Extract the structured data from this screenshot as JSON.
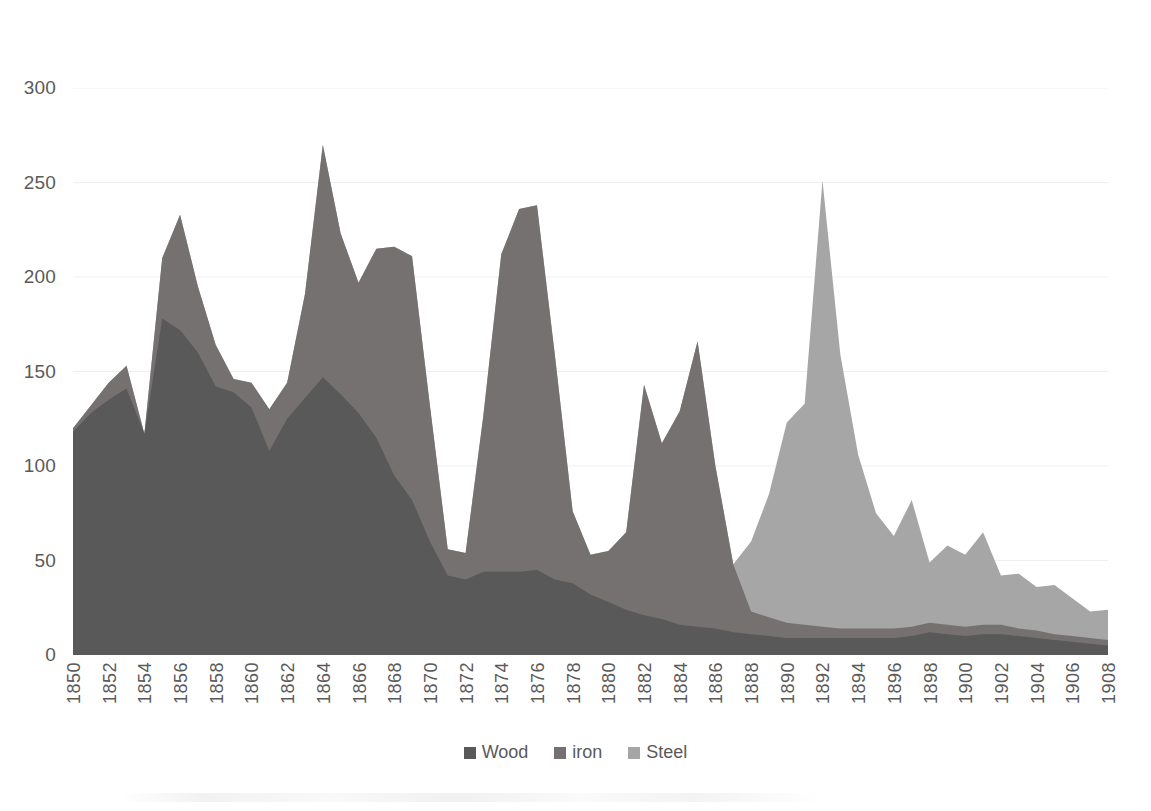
{
  "chart_data": {
    "type": "area",
    "stacked": true,
    "title": "",
    "subtitle": "",
    "xlabel": "",
    "ylabel": "",
    "xlim": [
      1850,
      1908
    ],
    "ylim": [
      0,
      300
    ],
    "grid": true,
    "grid_axis": "y",
    "legend_position": "bottom",
    "y_ticks": [
      0,
      50,
      100,
      150,
      200,
      250,
      300
    ],
    "x_tick_labels": [
      "1850",
      "1852",
      "1854",
      "1856",
      "1858",
      "1860",
      "1862",
      "1864",
      "1866",
      "1868",
      "1870",
      "1872",
      "1874",
      "1876",
      "1878",
      "1880",
      "1882",
      "1884",
      "1886",
      "1888",
      "1890",
      "1892",
      "1894",
      "1896",
      "1898",
      "1900",
      "1902",
      "1904",
      "1906",
      "1908"
    ],
    "x": [
      1850,
      1851,
      1852,
      1853,
      1854,
      1855,
      1856,
      1857,
      1858,
      1859,
      1860,
      1861,
      1862,
      1863,
      1864,
      1865,
      1866,
      1867,
      1868,
      1869,
      1870,
      1871,
      1872,
      1873,
      1874,
      1875,
      1876,
      1877,
      1878,
      1879,
      1880,
      1881,
      1882,
      1883,
      1884,
      1885,
      1886,
      1887,
      1888,
      1889,
      1890,
      1891,
      1892,
      1893,
      1894,
      1895,
      1896,
      1897,
      1898,
      1899,
      1900,
      1901,
      1902,
      1903,
      1904,
      1905,
      1906,
      1907,
      1908
    ],
    "series": [
      {
        "name": "Wood",
        "color": "#595959",
        "values": [
          118,
          128,
          135,
          141,
          117,
          178,
          172,
          160,
          142,
          139,
          131,
          108,
          125,
          136,
          147,
          138,
          128,
          115,
          95,
          82,
          60,
          42,
          40,
          44,
          44,
          44,
          45,
          40,
          38,
          32,
          28,
          24,
          21,
          19,
          16,
          15,
          14,
          12,
          11,
          10,
          9,
          9,
          9,
          9,
          9,
          9,
          9,
          10,
          12,
          11,
          10,
          11,
          11,
          10,
          9,
          8,
          7,
          6,
          5
        ]
      },
      {
        "name": "iron",
        "color": "#767171",
        "values": [
          2,
          4,
          9,
          12,
          0,
          32,
          61,
          35,
          22,
          7,
          13,
          22,
          19,
          55,
          123,
          85,
          69,
          100,
          121,
          129,
          72,
          14,
          14,
          83,
          168,
          192,
          193,
          119,
          38,
          21,
          27,
          41,
          122,
          93,
          113,
          151,
          86,
          36,
          12,
          10,
          8,
          7,
          6,
          5,
          5,
          5,
          5,
          5,
          5,
          5,
          5,
          5,
          5,
          4,
          4,
          3,
          3,
          3,
          3
        ]
      },
      {
        "name": "Steel",
        "color": "#a6a6a6",
        "values": [
          0,
          0,
          0,
          0,
          0,
          0,
          0,
          0,
          0,
          0,
          0,
          0,
          0,
          0,
          0,
          0,
          0,
          0,
          0,
          0,
          0,
          0,
          0,
          0,
          0,
          0,
          0,
          0,
          0,
          0,
          0,
          0,
          0,
          0,
          0,
          0,
          0,
          0,
          37,
          65,
          106,
          117,
          236,
          145,
          92,
          61,
          49,
          67,
          32,
          42,
          38,
          49,
          26,
          29,
          23,
          26,
          20,
          14,
          16
        ]
      }
    ],
    "totals_note": ""
  },
  "legend": {
    "items": [
      {
        "label": "Wood",
        "color": "#595959",
        "swatch": "square-swatch"
      },
      {
        "label": "iron",
        "color": "#767171",
        "swatch": "square-swatch"
      },
      {
        "label": "Steel",
        "color": "#a6a6a6",
        "swatch": "square-swatch"
      }
    ]
  },
  "axes": {
    "y_max_label": "300",
    "y_min_label": "0"
  }
}
